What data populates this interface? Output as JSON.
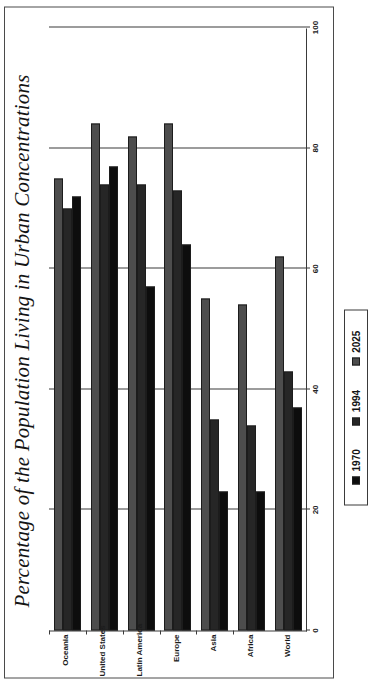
{
  "chart_data": {
    "type": "bar",
    "orientation": "horizontal",
    "title": "Percentage of the Population Living in Urban Concentrations",
    "xlabel": "",
    "ylabel": "",
    "categories": [
      "World",
      "Africa",
      "Asia",
      "Europe",
      "Latin America",
      "United States",
      "Oceania"
    ],
    "series": [
      {
        "name": "1970",
        "color": "#0d0d0d",
        "values": [
          37,
          23,
          23,
          64,
          57,
          77,
          72
        ]
      },
      {
        "name": "1994",
        "color": "#262626",
        "values": [
          43,
          34,
          35,
          73,
          74,
          74,
          70
        ]
      },
      {
        "name": "2025",
        "color": "#4d4d4d",
        "values": [
          62,
          54,
          55,
          84,
          82,
          84,
          75
        ]
      }
    ],
    "value_axis": {
      "ticks": [
        0,
        20,
        40,
        60,
        80,
        100
      ],
      "tick_labels": [
        "0",
        "20",
        "40",
        "60",
        "80",
        "100"
      ],
      "min": 0,
      "max": 100
    },
    "grid": true,
    "legend_position": "bottom"
  },
  "legend": {
    "entries": [
      {
        "label": "1970",
        "color": "#0d0d0d"
      },
      {
        "label": "1994",
        "color": "#262626"
      },
      {
        "label": "2025",
        "color": "#4d4d4d"
      }
    ]
  }
}
